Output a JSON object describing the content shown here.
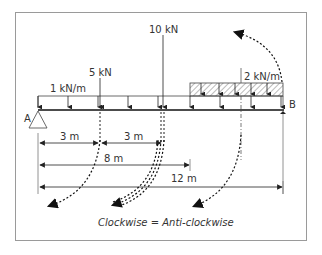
{
  "diagram": {
    "colors": {
      "line": "#333333",
      "frame": "#9a9a9a",
      "hatch": "#555555"
    },
    "supports": {
      "left_label": "A",
      "right_label": "B"
    },
    "loads": {
      "udl_1": "1 kN/m",
      "point_1": "5 kN",
      "point_2": "10 kN",
      "udl_2": "2 kN/m"
    },
    "dimensions": {
      "d1": "3 m",
      "d2": "3 m",
      "d3": "8 m",
      "d4": "12 m"
    },
    "caption": "Clockwise = Anti-clockwise"
  }
}
